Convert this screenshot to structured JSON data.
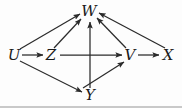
{
  "figure": {
    "background_color": "#fdfdfd",
    "stroke_color": "#2b2b2b",
    "label_color": "#1a1a1a",
    "width": 182,
    "height": 108
  },
  "nodes": [
    {
      "id": "U",
      "label": "U",
      "x": 14,
      "y": 55
    },
    {
      "id": "Z",
      "label": "Z",
      "x": 51,
      "y": 55
    },
    {
      "id": "W",
      "label": "W",
      "x": 89,
      "y": 11
    },
    {
      "id": "V",
      "label": "V",
      "x": 130,
      "y": 55
    },
    {
      "id": "X",
      "label": "X",
      "x": 168,
      "y": 55
    },
    {
      "id": "Y",
      "label": "Y",
      "x": 90,
      "y": 95
    }
  ],
  "edges": [
    {
      "from": "U",
      "to": "Z",
      "x1": 22,
      "y1": 55,
      "x2": 43,
      "y2": 55
    },
    {
      "from": "U",
      "to": "W",
      "x1": 20,
      "y1": 49,
      "x2": 80,
      "y2": 14
    },
    {
      "from": "U",
      "to": "Y",
      "x1": 20,
      "y1": 61,
      "x2": 82,
      "y2": 92
    },
    {
      "from": "Z",
      "to": "W",
      "x1": 54,
      "y1": 48,
      "x2": 81,
      "y2": 19
    },
    {
      "from": "Z",
      "to": "V",
      "x1": 60,
      "y1": 55,
      "x2": 122,
      "y2": 55
    },
    {
      "from": "Y",
      "to": "W",
      "x1": 90,
      "y1": 88,
      "x2": 90,
      "y2": 22
    },
    {
      "from": "Y",
      "to": "V",
      "x1": 83,
      "y1": 88,
      "x2": 124,
      "y2": 62
    },
    {
      "from": "V",
      "to": "W",
      "x1": 126,
      "y1": 48,
      "x2": 97,
      "y2": 18
    },
    {
      "from": "V",
      "to": "X",
      "x1": 138,
      "y1": 55,
      "x2": 159,
      "y2": 55
    },
    {
      "from": "X",
      "to": "W",
      "x1": 165,
      "y1": 48,
      "x2": 99,
      "y2": 13
    }
  ]
}
